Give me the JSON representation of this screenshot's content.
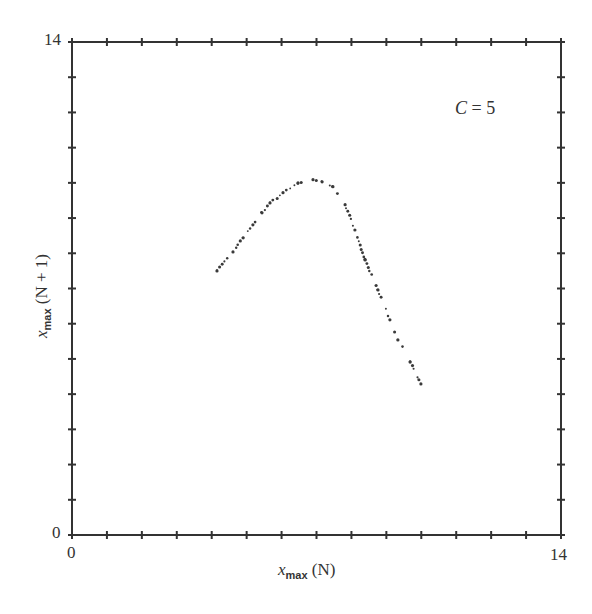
{
  "chart_data": {
    "type": "scatter",
    "title": "",
    "xlabel": "x_max (N)",
    "ylabel": "x_max (N + 1)",
    "xlim": [
      0,
      14
    ],
    "ylim": [
      0,
      14
    ],
    "grid": false,
    "x_tick_labels": [
      "0",
      "14"
    ],
    "y_tick_labels": [
      "0",
      "14"
    ],
    "minor_ticks_every": 1,
    "annotations": [
      "C = 5"
    ],
    "series": [
      {
        "name": "return map points",
        "x": [
          4.15,
          4.61,
          4.9,
          5.18,
          5.44,
          5.67,
          6.04,
          6.47,
          6.9,
          7.16,
          7.47,
          7.82,
          8.1,
          8.39,
          8.76,
          9.1,
          9.33,
          9.68,
          9.99
        ],
        "y": [
          7.5,
          8.04,
          8.44,
          8.81,
          9.15,
          9.43,
          9.72,
          10.0,
          10.09,
          10.03,
          9.89,
          9.38,
          8.66,
          7.81,
          6.96,
          6.11,
          5.54,
          4.91,
          4.29
        ]
      }
    ]
  },
  "labels": {
    "x_axis_var": "x",
    "x_axis_sub": "max",
    "x_axis_arg": " (N)",
    "y_axis_var": "x",
    "y_axis_sub": "max",
    "y_axis_arg": " (N + 1)",
    "x_min": "0",
    "x_max": "14",
    "y_min": "0",
    "y_max": "14",
    "annotation_var": "C",
    "annotation_rest": " = 5"
  },
  "colors": {
    "axis": "#333333",
    "points": "#3a3a3a",
    "background": "#ffffff"
  }
}
